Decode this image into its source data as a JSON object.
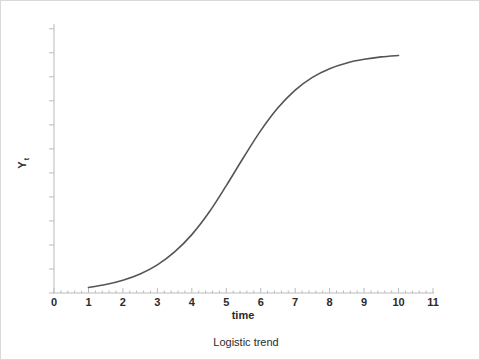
{
  "figure": {
    "background_color": "#ffffff",
    "border_color": "#d9d9d9",
    "width": 480,
    "height": 360
  },
  "caption": {
    "text": "Logistic trend"
  },
  "chart_data": {
    "type": "line",
    "title": "",
    "subtitle": "",
    "caption": "Logistic trend",
    "xlabel": "time",
    "ylabel": "Y",
    "ylabel_subscript": "t",
    "ylabel_full": "Yt",
    "xlim": [
      0,
      11
    ],
    "ylim": [
      0,
      1.12
    ],
    "grid": false,
    "legend": null,
    "legend_position": "none",
    "x_major_ticks": [
      0,
      1,
      2,
      3,
      4,
      5,
      6,
      7,
      8,
      9,
      10,
      11
    ],
    "x_tick_labels": [
      "0",
      "1",
      "2",
      "3",
      "4",
      "5",
      "6",
      "7",
      "8",
      "9",
      "10",
      "11"
    ],
    "x_minor_ticks_per_interval": 4,
    "y_major_ticks": [
      0,
      0.1,
      0.2,
      0.3,
      0.4,
      0.5,
      0.6,
      0.7,
      0.8,
      0.9,
      1.0,
      1.1
    ],
    "y_tick_labels": [],
    "y_axis_labeled": false,
    "axis_color": "#bbbbbb",
    "tick_color": "#bbbbbb",
    "series": [
      {
        "name": "Logistic trend",
        "color": "#555555",
        "line_width": 1.6,
        "style": "solid",
        "markers": false,
        "model": "logistic",
        "model_params": {
          "saturation_L": 1.0,
          "growth_rate_k": 0.85,
          "midpoint_t0": 5.3
        },
        "x": [
          1.0,
          1.5,
          2.0,
          2.5,
          3.0,
          3.5,
          4.0,
          4.5,
          5.0,
          5.5,
          6.0,
          6.5,
          7.0,
          7.5,
          8.0,
          8.5,
          9.0,
          9.5,
          10.0
        ],
        "values": [
          0.023,
          0.035,
          0.053,
          0.079,
          0.117,
          0.171,
          0.243,
          0.336,
          0.447,
          0.564,
          0.676,
          0.771,
          0.845,
          0.898,
          0.934,
          0.958,
          0.973,
          0.983,
          0.989
        ]
      }
    ]
  }
}
